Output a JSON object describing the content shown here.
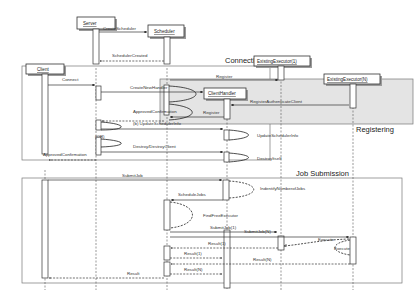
{
  "lifelines": {
    "server": "Server",
    "scheduler": "Scheduler",
    "client": "Client",
    "client_handler": "ClientHandler",
    "executor1": "ExistingExecutor(1)",
    "executorN": "ExistingExecutor(N)"
  },
  "frames": {
    "connection": "Connection",
    "registering": "Registering",
    "job_submission": "Job Submission"
  },
  "messages": {
    "create_scheduler": "CreateScheduler",
    "scheduler_created": "SchedulerCreated",
    "connect": "Connect",
    "create_new_handler": "CreateNewHandler",
    "register": "Register",
    "register_authenticate": "RegisterAuthenticateClient",
    "register_return": "Register",
    "approved_confirmation": "ApprovedConfirmation",
    "b_update": "(b) UpdateSchedulerInfo",
    "or_label": "(OR)",
    "update_scheduler_info": "UpdateSchedulerInfo",
    "destroy": "Destroy/DestroyClient",
    "destroy_itself": "DestroyItself",
    "approve_confirmation_client": "ApprovedConfirmation",
    "submit_job": "SubmitJob",
    "identify_number_of_jobs": "IndentifyNumberofJobs",
    "schedule_jobs": "ScheduleJobs",
    "find_free_executor": "FindFreeExecutor",
    "submit_jobs_1": "SubmitJob(1)",
    "submit_jobs_n": "SubmitJob(N)",
    "execute_1": "Execute",
    "execute_n": "Execute",
    "result_1a": "Result(1)",
    "result_1b": "Result(1)",
    "result_na": "Result(N)",
    "result_nb": "Result(N)",
    "result": "Result"
  },
  "colors": {
    "line": "#333333",
    "shaded_frame": "#e4e4e4",
    "background": "#ffffff"
  }
}
